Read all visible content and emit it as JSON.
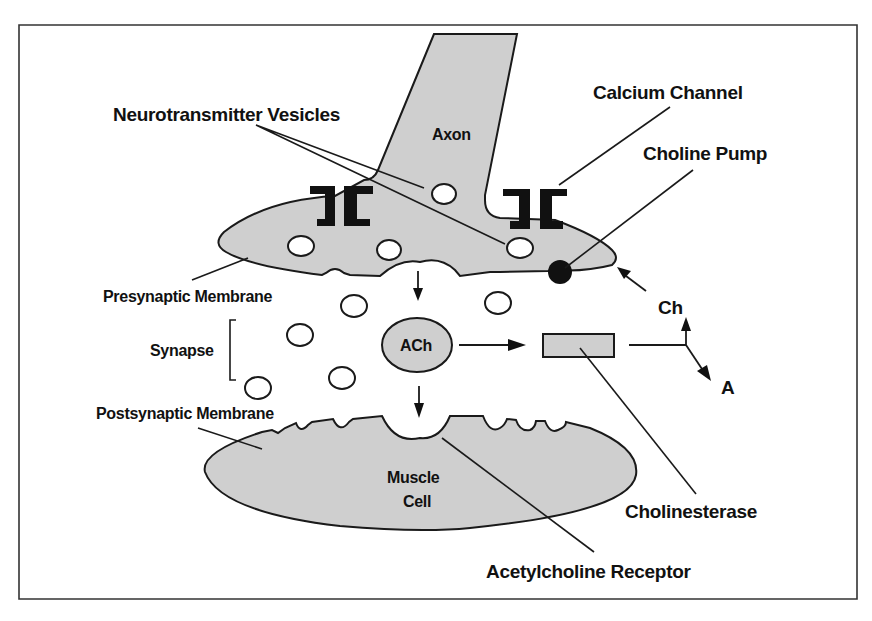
{
  "figure": {
    "colors": {
      "fill": "#cfcfcf",
      "stroke": "#1a1a1a",
      "channel": "#111111",
      "pump": "#111111",
      "background": "#ffffff"
    }
  },
  "labels": {
    "neurotransmitter_vesicles": "Neurotransmitter Vesicles",
    "axon": "Axon",
    "calcium_channel": "Calcium Channel",
    "choline_pump": "Choline Pump",
    "presynaptic_membrane": "Presynaptic Membrane",
    "synapse": "Synapse",
    "ach": "ACh",
    "ch": "Ch",
    "a": "A",
    "postsynaptic_membrane": "Postsynaptic Membrane",
    "muscle_line1": "Muscle",
    "muscle_line2": "Cell",
    "cholinesterase": "Cholinesterase",
    "acetylcholine_receptor": "Acetylcholine Receptor"
  },
  "diagram_nodes": [
    {
      "id": "axon",
      "label": "Axon",
      "shape": "tapered tube"
    },
    {
      "id": "presynaptic",
      "label": "Presynaptic Membrane",
      "shape": "elongated blob"
    },
    {
      "id": "vesicles",
      "label": "Neurotransmitter Vesicles",
      "shape": "small circles",
      "count_in_terminal": 5,
      "count_in_synapse": 6
    },
    {
      "id": "calcium_channels",
      "label": "Calcium Channel",
      "shape": "bracket pair",
      "count": 2
    },
    {
      "id": "choline_pump",
      "label": "Choline Pump",
      "shape": "filled circle"
    },
    {
      "id": "ach",
      "label": "ACh",
      "shape": "ellipse"
    },
    {
      "id": "cholinesterase",
      "label": "Cholinesterase",
      "shape": "rectangle"
    },
    {
      "id": "postsynaptic",
      "label": "Postsynaptic Membrane",
      "shape": "notched ellipse top"
    },
    {
      "id": "muscle_cell",
      "label": "Muscle Cell",
      "shape": "ellipse"
    },
    {
      "id": "receptor",
      "label": "Acetylcholine Receptor",
      "shape": "notch"
    }
  ],
  "diagram_edges": [
    {
      "from": "presynaptic",
      "to": "ach",
      "type": "arrow",
      "direction": "down"
    },
    {
      "from": "ach",
      "to": "postsynaptic",
      "type": "arrow",
      "direction": "down"
    },
    {
      "from": "ach",
      "to": "cholinesterase",
      "type": "arrow",
      "direction": "right"
    },
    {
      "from": "cholinesterase",
      "to": "Ch",
      "type": "arrow",
      "direction": "up (split)"
    },
    {
      "from": "cholinesterase",
      "to": "A",
      "type": "arrow",
      "direction": "down-right (split)"
    },
    {
      "from": "Ch",
      "to": "choline_pump",
      "type": "arrow",
      "direction": "up-left"
    }
  ]
}
